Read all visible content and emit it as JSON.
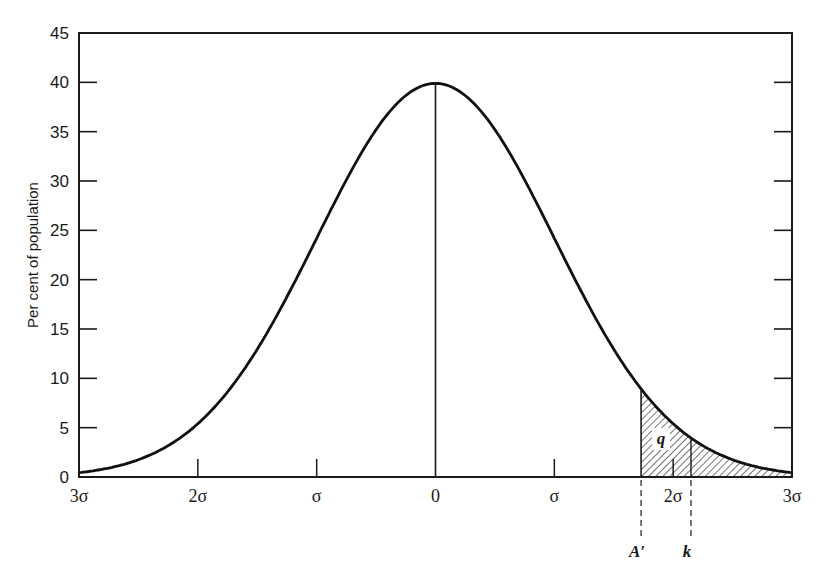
{
  "chart_data": {
    "type": "line",
    "title": "",
    "xlabel": "",
    "ylabel": "Per cent of population",
    "ylim": [
      0,
      45
    ],
    "xlim": [
      -3,
      3
    ],
    "grid": false,
    "legend": null,
    "y_ticks": [
      0,
      5,
      10,
      15,
      20,
      25,
      30,
      35,
      40,
      45
    ],
    "y_tick_labels": [
      "0",
      "5",
      "10",
      "15",
      "20",
      "25",
      "30",
      "35",
      "40",
      "45"
    ],
    "x_ticks": [
      -3,
      -2,
      -1,
      0,
      1,
      2,
      3
    ],
    "x_tick_labels": [
      "3σ",
      "2σ",
      "σ",
      "0",
      "σ",
      "2σ",
      "3σ"
    ],
    "series": [
      {
        "name": "Normal distribution",
        "x": [
          -3.0,
          -2.75,
          -2.5,
          -2.25,
          -2.0,
          -1.75,
          -1.5,
          -1.25,
          -1.0,
          -0.75,
          -0.5,
          -0.25,
          0.0,
          0.25,
          0.5,
          0.75,
          1.0,
          1.25,
          1.5,
          1.75,
          2.0,
          2.25,
          2.5,
          2.75,
          3.0
        ],
        "values": [
          0.4,
          0.9,
          1.8,
          3.2,
          5.4,
          8.6,
          13.0,
          18.3,
          24.2,
          30.1,
          35.2,
          38.7,
          39.9,
          38.7,
          35.2,
          30.1,
          24.2,
          18.3,
          13.0,
          8.6,
          5.4,
          3.2,
          1.8,
          0.9,
          0.4
        ]
      }
    ],
    "annotations": [
      {
        "type": "vertical-line",
        "x": 0,
        "label": "mean"
      },
      {
        "type": "shaded-region",
        "x_from": 1.73,
        "x_to": 3.0,
        "label": "q",
        "style": "hatched"
      },
      {
        "type": "dashed-marker",
        "x": 1.73,
        "label": "A′"
      },
      {
        "type": "dashed-marker",
        "x": 2.15,
        "label": "k"
      }
    ]
  },
  "labels": {
    "q": "q",
    "a_prime": "A′",
    "k": "k"
  }
}
